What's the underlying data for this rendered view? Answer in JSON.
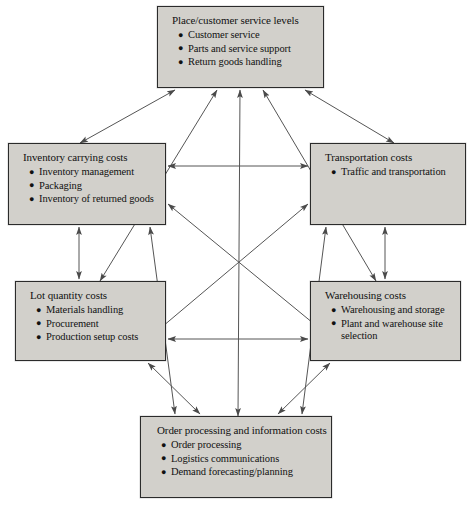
{
  "diagram": {
    "type": "relationship-diagram",
    "canvas": {
      "width": 474,
      "height": 512
    },
    "style": {
      "box_fill": "#d2d0cb",
      "box_border": "#2b2b2b",
      "connector_color": "#555555",
      "background": "#ffffff"
    },
    "nodes": [
      {
        "id": "place",
        "title": "Place/customer service levels",
        "items": [
          "Customer service",
          "Parts and service support",
          "Return goods handling"
        ],
        "x": 157,
        "y": 6,
        "w": 167,
        "h": 82
      },
      {
        "id": "inventory",
        "title": "Inventory carrying costs",
        "items": [
          "Inventory management",
          "Packaging",
          "Inventory of returned goods"
        ],
        "x": 8,
        "y": 143,
        "w": 158,
        "h": 82
      },
      {
        "id": "transportation",
        "title": "Transportation costs",
        "items": [
          "Traffic and transportation"
        ],
        "x": 310,
        "y": 143,
        "w": 156,
        "h": 82
      },
      {
        "id": "lot",
        "title": "Lot quantity costs",
        "items": [
          "Materials handling",
          "Procurement",
          "Production setup costs"
        ],
        "x": 15,
        "y": 281,
        "w": 151,
        "h": 80
      },
      {
        "id": "warehousing",
        "title": "Warehousing costs",
        "items": [
          "Warehousing and storage",
          "Plant and warehouse site selection"
        ],
        "x": 310,
        "y": 281,
        "w": 151,
        "h": 80
      },
      {
        "id": "order",
        "title": "Order processing and information costs",
        "items": [
          "Order processing",
          "Logistics communications",
          "Demand forecasting/planning"
        ],
        "x": 140,
        "y": 416,
        "w": 192,
        "h": 82
      }
    ],
    "connectors": [
      {
        "from": "inventory",
        "to": "place",
        "x1": 80,
        "y1": 143,
        "x2": 175,
        "y2": 90,
        "heads": "both"
      },
      {
        "from": "lot",
        "to": "place",
        "x1": 100,
        "y1": 281,
        "x2": 217,
        "y2": 90,
        "heads": "both"
      },
      {
        "from": "order",
        "to": "place",
        "x1": 238,
        "y1": 416,
        "x2": 240,
        "y2": 90,
        "heads": "both"
      },
      {
        "from": "warehousing",
        "to": "place",
        "x1": 376,
        "y1": 281,
        "x2": 263,
        "y2": 90,
        "heads": "both"
      },
      {
        "from": "transportation",
        "to": "place",
        "x1": 394,
        "y1": 143,
        "x2": 305,
        "y2": 90,
        "heads": "both"
      },
      {
        "from": "inventory",
        "to": "transportation",
        "x1": 168,
        "y1": 166,
        "x2": 308,
        "y2": 166,
        "heads": "both"
      },
      {
        "from": "lot",
        "to": "warehousing",
        "x1": 168,
        "y1": 339,
        "x2": 308,
        "y2": 339,
        "heads": "both"
      },
      {
        "from": "inventory",
        "to": "lot",
        "x1": 79,
        "y1": 227,
        "x2": 79,
        "y2": 279,
        "heads": "both"
      },
      {
        "from": "transportation",
        "to": "warehousing",
        "x1": 385,
        "y1": 227,
        "x2": 385,
        "y2": 279,
        "heads": "both"
      },
      {
        "from": "inventory",
        "to": "warehousing",
        "x1": 168,
        "y1": 204,
        "x2": 330,
        "y2": 337,
        "heads": "both"
      },
      {
        "from": "transportation",
        "to": "lot",
        "x1": 308,
        "y1": 204,
        "x2": 150,
        "y2": 337,
        "heads": "both"
      },
      {
        "from": "inventory",
        "to": "order",
        "x1": 150,
        "y1": 227,
        "x2": 175,
        "y2": 414,
        "heads": "both"
      },
      {
        "from": "lot",
        "to": "order",
        "x1": 148,
        "y1": 363,
        "x2": 200,
        "y2": 414,
        "heads": "both"
      },
      {
        "from": "warehousing",
        "to": "order",
        "x1": 330,
        "y1": 363,
        "x2": 278,
        "y2": 414,
        "heads": "both"
      },
      {
        "from": "transportation",
        "to": "order",
        "x1": 326,
        "y1": 227,
        "x2": 302,
        "y2": 414,
        "heads": "both"
      }
    ]
  }
}
